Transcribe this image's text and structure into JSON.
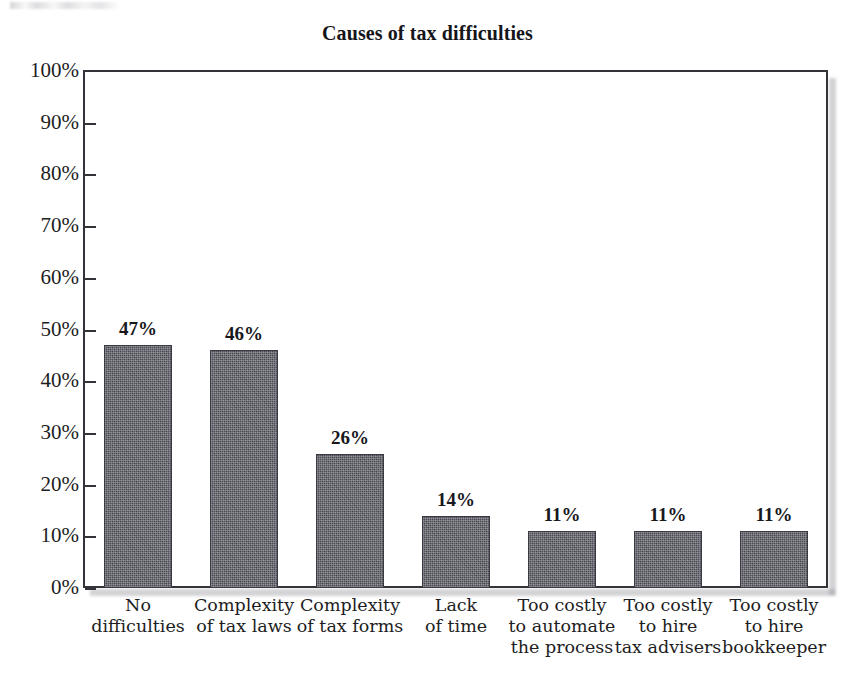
{
  "chart_data": {
    "type": "bar",
    "title": "Causes of tax difficulties",
    "xlabel": "",
    "ylabel": "",
    "ylim": [
      0,
      100
    ],
    "y_unit": "%",
    "grid": false,
    "legend": null,
    "categories": [
      "No difficulties",
      "Complexity of tax laws",
      "Complexity of tax forms",
      "Lack of time",
      "Too costly to automate the process",
      "Too costly to hire tax advisers",
      "Too costly to hire bookkeeper"
    ],
    "category_lines": [
      [
        "No",
        "difficulties"
      ],
      [
        "Complexity",
        "of tax laws"
      ],
      [
        "Complexity",
        "of tax forms"
      ],
      [
        "Lack",
        "of time"
      ],
      [
        "Too costly",
        "to automate",
        "the process"
      ],
      [
        "Too costly",
        "to hire",
        "tax advisers"
      ],
      [
        "Too costly",
        "to hire",
        "bookkeeper"
      ]
    ],
    "values": [
      47,
      46,
      26,
      14,
      11,
      11,
      11
    ],
    "value_labels": [
      "47%",
      "46%",
      "26%",
      "14%",
      "11%",
      "11%",
      "11%"
    ],
    "y_ticks": [
      0,
      10,
      20,
      30,
      40,
      50,
      60,
      70,
      80,
      90,
      100
    ],
    "y_tick_labels": [
      "0%",
      "10%",
      "20%",
      "30%",
      "40%",
      "50%",
      "60%",
      "70%",
      "80%",
      "90%",
      "100%"
    ],
    "bar_color": "#50505a",
    "axis_color": "#33333a",
    "text_color": "#1d1d22",
    "background_color": "#ffffff"
  },
  "title": "Causes of tax difficulties"
}
